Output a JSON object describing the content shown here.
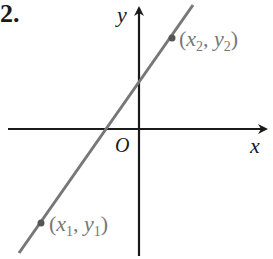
{
  "problem_number": "2.",
  "axes": {
    "x_label": "x",
    "y_label": "y",
    "origin_label": "O"
  },
  "points": [
    {
      "name": "P1",
      "label_x": "x",
      "label_x_sub": "1",
      "label_y": "y",
      "label_y_sub": "1",
      "open": "(",
      "comma": ", ",
      "close": ")"
    },
    {
      "name": "P2",
      "label_x": "x",
      "label_x_sub": "2",
      "label_y": "y",
      "label_y_sub": "2",
      "open": "(",
      "comma": ", ",
      "close": ")"
    }
  ],
  "colors": {
    "axes": "#1a1a1a",
    "line": "#777777",
    "labels": "#777777"
  }
}
